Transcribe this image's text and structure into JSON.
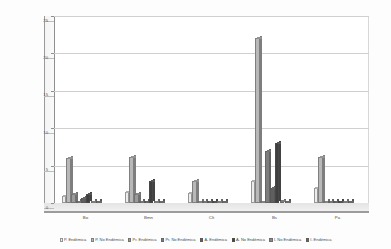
{
  "chart_data": {
    "type": "bar",
    "title": "",
    "subtitle": "",
    "xlabel": "",
    "ylabel": "Número de Especies",
    "ylim": [
      0,
      25
    ],
    "yticks": [
      "0",
      "5",
      "10",
      "15",
      "20",
      "25"
    ],
    "grid": true,
    "legend_position": "bottom",
    "categories": [
      "Bo",
      "Bmn",
      "Clt",
      "Bs",
      "Pa"
    ],
    "series": [
      {
        "name": "P. Endémica",
        "color": "#ececec",
        "values": [
          1,
          1.5,
          1.3,
          3,
          2
        ]
      },
      {
        "name": "P. No Endémica",
        "color": "#b8b8b8",
        "values": [
          6,
          6.2,
          3,
          22,
          6.2
        ]
      },
      {
        "name": "Pr. Endémica",
        "color": "#9a9a9a",
        "values": [
          1.2,
          1.2,
          0.2,
          0.2,
          0.15
        ]
      },
      {
        "name": "Pr. No Endémica",
        "color": "#7d7d7d",
        "values": [
          0.15,
          0.15,
          0.2,
          7,
          0.15
        ]
      },
      {
        "name": "A. Endémica",
        "color": "#5f5f5f",
        "values": [
          0.7,
          0.2,
          0.15,
          2,
          0.15
        ]
      },
      {
        "name": "A. No Endémica",
        "color": "#3f3f3f",
        "values": [
          1.2,
          3,
          0.2,
          8,
          0.15
        ]
      },
      {
        "name": "I. No Endémica",
        "color": "#8a8a8a",
        "values": [
          0.2,
          0.2,
          0.2,
          0.25,
          0.15
        ]
      },
      {
        "name": "I. Endémica",
        "color": "#666666",
        "values": [
          0.15,
          0.15,
          0.15,
          0.2,
          0.15
        ]
      }
    ]
  },
  "axis": {
    "y_title": "Número de Especies",
    "y_ticks": [
      "25",
      "20",
      "15",
      "10",
      "5",
      "0"
    ],
    "x_ticks": [
      "Bo",
      "Bmn",
      "Clt",
      "Bs",
      "Pa"
    ]
  },
  "legend": {
    "items": [
      {
        "label": "P. Endémica",
        "color": "#ececec"
      },
      {
        "label": "P. No Endémica",
        "color": "#b8b8b8"
      },
      {
        "label": "Pr. Endémica",
        "color": "#9a9a9a"
      },
      {
        "label": "Pr. No Endémica",
        "color": "#7d7d7d"
      },
      {
        "label": "A. Endémica",
        "color": "#5f5f5f"
      },
      {
        "label": "A. No Endémica",
        "color": "#3f3f3f"
      },
      {
        "label": "I. No Endémica",
        "color": "#8a8a8a"
      },
      {
        "label": "I. Endémica",
        "color": "#666666"
      }
    ]
  },
  "colors": {
    "plot_background": "#ffffff",
    "page_background": "#fdfdfd",
    "gridline": "#cfcfcf",
    "axis_line": "#8f8f8f",
    "text": "#4a4a4a"
  }
}
